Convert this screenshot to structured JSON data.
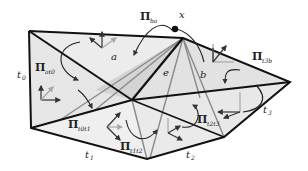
{
  "diagram": {
    "point_label": "x",
    "faces": {
      "a": "a",
      "b": "b",
      "e": "e"
    },
    "edges": {
      "t0": {
        "base": "t",
        "sub": "0"
      },
      "t1": {
        "base": "t",
        "sub": "1"
      },
      "t2": {
        "base": "t",
        "sub": "2"
      },
      "t3": {
        "base": "t",
        "sub": "3"
      }
    },
    "operators": {
      "pi_ba": {
        "base": "Π",
        "sub": "ba"
      },
      "pi_at0": {
        "base": "Π",
        "sub": "at0"
      },
      "pi_t0t1": {
        "base": "Π",
        "sub": "t0t1"
      },
      "pi_t1t2": {
        "base": "Π",
        "sub": "t1t2"
      },
      "pi_t2t3": {
        "base": "Π",
        "sub": "t2t3"
      },
      "pi_t3b": {
        "base": "Π",
        "sub": "t3b"
      }
    },
    "colors": {
      "face_light": "#ececec",
      "face_mid": "#d9d9d9",
      "face_dark": "#c8c8c8",
      "edge_dark": "#111111",
      "edge_gray": "#7a7a7a",
      "arrow_dark": "#333333",
      "arrow_light": "#a8a8a8"
    }
  }
}
